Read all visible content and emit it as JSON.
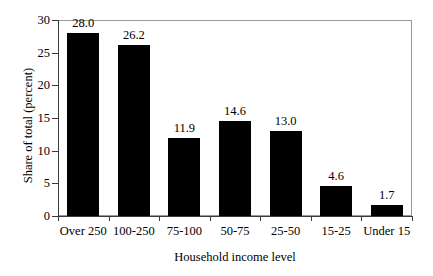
{
  "chart_data": {
    "type": "bar",
    "title": "",
    "xlabel": "Household income level",
    "ylabel": "Share of total (percent)",
    "categories": [
      "Over 250",
      "100-250",
      "75-100",
      "50-75",
      "25-50",
      "15-25",
      "Under 15"
    ],
    "values": [
      28.0,
      26.2,
      11.9,
      14.6,
      13.0,
      4.6,
      1.7
    ],
    "value_labels": [
      "28.0",
      "26.2",
      "11.9",
      "14.6",
      "13.0",
      "4.6",
      "1.7"
    ],
    "ylim": [
      0,
      30
    ],
    "yticks": [
      0,
      5,
      10,
      15,
      20,
      25,
      30
    ],
    "ytick_labels": [
      "0",
      "5",
      "10",
      "15",
      "20",
      "25",
      "30"
    ],
    "grid": false,
    "legend": null,
    "bar_color": "#000000",
    "frame_color": "#9a9a9a",
    "axis_color": "#3a3a3a",
    "background": "#ffffff"
  }
}
